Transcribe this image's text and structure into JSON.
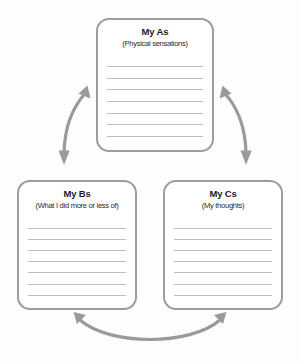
{
  "diagram": {
    "background_color": "#fdfdfd",
    "border_color": "#9c9c9c",
    "line_color": "#bdbdbd",
    "arrow_color": "#9a9a9a",
    "text_color": "#1c1c1c",
    "boxes": [
      {
        "id": "a",
        "title": "My As",
        "subtitle": "(Physical sensations)",
        "line_count": 7,
        "position": "top-center"
      },
      {
        "id": "b",
        "title": "My Bs",
        "subtitle": "(What I did more or less of)",
        "line_count": 7,
        "position": "bottom-left"
      },
      {
        "id": "c",
        "title": "My Cs",
        "subtitle": "(My thoughts)",
        "line_count": 7,
        "position": "bottom-right"
      }
    ],
    "arrows": [
      {
        "id": "a-b",
        "from": "My As",
        "to": "My Bs",
        "style": "double-headed-curved",
        "side": "left"
      },
      {
        "id": "a-c",
        "from": "My As",
        "to": "My Cs",
        "style": "double-headed-curved",
        "side": "right"
      },
      {
        "id": "b-c",
        "from": "My Bs",
        "to": "My Cs",
        "style": "double-headed-curved",
        "side": "bottom"
      }
    ]
  }
}
